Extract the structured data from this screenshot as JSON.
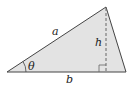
{
  "diagram": {
    "type": "triangle-area",
    "fill_color": "#e3e3e3",
    "stroke_color": "#444444",
    "vertices": {
      "left": [
        7,
        72
      ],
      "top": [
        106,
        7
      ],
      "right": [
        126,
        72
      ]
    },
    "labels": {
      "side_a": "a",
      "side_b": "b",
      "height": "h",
      "angle": "θ"
    },
    "features": [
      "dashed altitude from top vertex to base",
      "right-angle marker at foot of altitude",
      "angle arc at left vertex"
    ]
  }
}
